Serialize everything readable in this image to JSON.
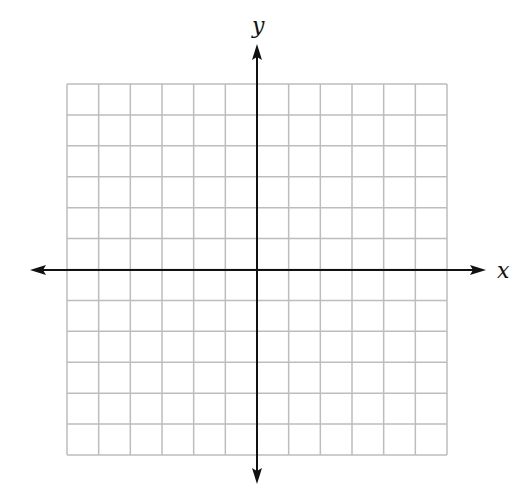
{
  "diagram": {
    "type": "coordinate-plane",
    "grid": {
      "columns": 12,
      "rows": 12,
      "left": 67,
      "top": 84,
      "right": 447,
      "bottom": 455,
      "line_color": "#bdbdbd"
    },
    "origin": {
      "x": 257,
      "y": 270
    },
    "x_axis": {
      "label": "x",
      "from": 30,
      "to": 486
    },
    "y_axis": {
      "label": "y",
      "from": 44,
      "to": 484
    },
    "axis_color": "#111111"
  }
}
